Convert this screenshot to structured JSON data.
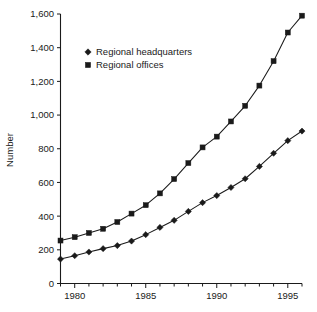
{
  "chart_data": {
    "type": "line",
    "title": "",
    "subtitle": "",
    "xlabel": "",
    "ylabel": "Number",
    "xlim": [
      1979,
      1996
    ],
    "ylim": [
      0,
      1600
    ],
    "grid": false,
    "legend_position": "upper-left-inside",
    "x": [
      1979,
      1980,
      1981,
      1982,
      1983,
      1984,
      1985,
      1986,
      1987,
      1988,
      1989,
      1990,
      1991,
      1992,
      1993,
      1994,
      1995,
      1996
    ],
    "x_tick_labels": [
      "1980",
      "1985",
      "1990",
      "1995"
    ],
    "x_tick_values": [
      1980,
      1985,
      1990,
      1995
    ],
    "x_minor_ticks": [
      1979,
      1981,
      1982,
      1983,
      1984,
      1986,
      1987,
      1988,
      1989,
      1991,
      1992,
      1993,
      1994,
      1996
    ],
    "y_tick_labels": [
      "0",
      "200",
      "400",
      "600",
      "800",
      "1,000",
      "1,200",
      "1,400",
      "1,600"
    ],
    "y_tick_values": [
      0,
      200,
      400,
      600,
      800,
      1000,
      1200,
      1400,
      1600
    ],
    "series": [
      {
        "name": "Regional headquarters",
        "marker": "diamond",
        "color": "#1a1a1a",
        "values": [
          145,
          165,
          187,
          207,
          225,
          252,
          290,
          333,
          375,
          428,
          480,
          522,
          570,
          622,
          695,
          773,
          848,
          905
        ]
      },
      {
        "name": "Regional offices",
        "marker": "square",
        "color": "#1a1a1a",
        "values": [
          255,
          275,
          300,
          325,
          365,
          415,
          465,
          535,
          620,
          715,
          808,
          872,
          962,
          1055,
          1175,
          1320,
          1490,
          1590
        ]
      }
    ]
  },
  "legend": {
    "entries": [
      {
        "label": "Regional headquarters",
        "marker": "diamond"
      },
      {
        "label": "Regional offices",
        "marker": "square"
      }
    ]
  },
  "axes": {
    "y_title": "Number"
  }
}
